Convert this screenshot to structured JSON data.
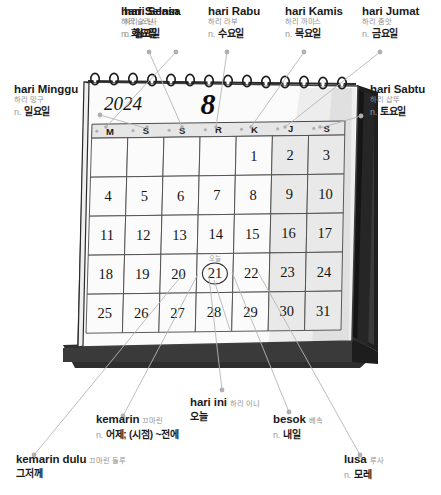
{
  "calendar": {
    "year": "2024",
    "month": "8",
    "weekday_headers": [
      "M",
      "S",
      "S",
      "R",
      "K",
      "J",
      "S"
    ],
    "weeks": [
      [
        "",
        "",
        "",
        "",
        "1",
        "2",
        "3"
      ],
      [
        "4",
        "5",
        "6",
        "7",
        "8",
        "9",
        "10"
      ],
      [
        "11",
        "12",
        "13",
        "14",
        "15",
        "16",
        "17"
      ],
      [
        "18",
        "19",
        "20",
        "21",
        "22",
        "23",
        "24"
      ],
      [
        "25",
        "26",
        "27",
        "28",
        "29",
        "30",
        "31"
      ]
    ],
    "today": "21",
    "today_marker_label": "오늘",
    "weekend_columns": [
      5,
      6
    ],
    "colors": {
      "paper": "#fbfbfb",
      "cell_weekend": "#e9e9e9",
      "header_band": "#e6e6e6",
      "stand_dark": "#2b2b2b",
      "rule": "#4a4a4a",
      "leader": "#b0b0b0"
    }
  },
  "annotations": {
    "top": [
      {
        "term": "hari Senin",
        "rom": "하리 스닌",
        "pos": "n.",
        "def": "월요일"
      },
      {
        "term": "hari Selasa",
        "rom": "하리 슬라사",
        "pos": "n.",
        "def": "화요일"
      },
      {
        "term": "hari Rabu",
        "rom": "하리 라부",
        "pos": "n.",
        "def": "수요일"
      },
      {
        "term": "hari Kamis",
        "rom": "하리 까미스",
        "pos": "n.",
        "def": "목요일"
      },
      {
        "term": "hari Jumat",
        "rom": "하리 줌앗",
        "pos": "n.",
        "def": "금요일"
      }
    ],
    "left": {
      "term": "hari Minggu",
      "rom": "하리 밍구",
      "pos": "n.",
      "def": "일요일"
    },
    "right": {
      "term": "hari Sabtu",
      "rom": "하리 삽뚜",
      "pos": "n.",
      "def": "토요일"
    },
    "bottom": {
      "hari_ini": {
        "term": "hari ini",
        "rom": "하리 이니",
        "def": "오늘"
      },
      "kemarin": {
        "term": "kemarin",
        "rom": "끄마린",
        "pos": "n.",
        "def": "어제; (시점) ~전에"
      },
      "besok": {
        "term": "besok",
        "rom": "베속",
        "pos": "n.",
        "def": "내일"
      },
      "kemarin_dulu": {
        "term": "kemarin dulu",
        "rom": "끄마린 둘루",
        "def": "그저께"
      },
      "lusa": {
        "term": "lusa",
        "rom": "루사",
        "pos": "n.",
        "def": "모레"
      }
    }
  }
}
